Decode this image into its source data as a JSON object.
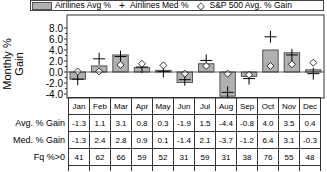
{
  "chart_data": {
    "type": "bar",
    "title": "",
    "xlabel": "",
    "ylabel": "Monthly % Gain",
    "ylim": [
      -4.0,
      9.0
    ],
    "yticks": [
      "8.0",
      "6.0",
      "4.0",
      "2.0",
      "0.0",
      "-2.0",
      "-4.0"
    ],
    "ytick_values": [
      8,
      6,
      4,
      2,
      0,
      -2,
      -4
    ],
    "grid": false,
    "legend_position": "top",
    "categories": [
      "Jan",
      "Feb",
      "Mar",
      "Apr",
      "May",
      "Jun",
      "Jul",
      "Aug",
      "Sep",
      "Oct",
      "Nov",
      "Dec"
    ],
    "series": [
      {
        "name": "Airilines Avg %",
        "kind": "bar",
        "values": [
          -1.3,
          1.1,
          3.1,
          0.8,
          0.3,
          -1.9,
          1.5,
          -4.4,
          -0.8,
          4.0,
          3.5,
          0.4
        ]
      },
      {
        "name": "Airilines Med %",
        "kind": "marker-plus",
        "values": [
          -1.3,
          2.4,
          2.8,
          0.9,
          0.1,
          -1.4,
          2.1,
          -3.7,
          -1.2,
          6.4,
          3.1,
          -0.3
        ]
      },
      {
        "name": "S&P 500 Avg. % Gain",
        "kind": "marker-diamond",
        "values": [
          0.1,
          0.1,
          1.3,
          1.5,
          1.2,
          -0.3,
          1.1,
          -0.3,
          -0.5,
          1.1,
          1.4,
          1.7
        ]
      }
    ],
    "table": {
      "header": [
        "Jan",
        "Feb",
        "Mar",
        "Apr",
        "May",
        "Jun",
        "Jul",
        "Aug",
        "Sep",
        "Oct",
        "Nov",
        "Dec"
      ],
      "rows": [
        {
          "label": "Avg. % Gain",
          "values": [
            "-1.3",
            "1.1",
            "3.1",
            "0.8",
            "0.3",
            "-1.9",
            "1.5",
            "-4.4",
            "-0.8",
            "4.0",
            "3.5",
            "0.4"
          ]
        },
        {
          "label": "Med. % Gain",
          "values": [
            "-1.3",
            "2.4",
            "2.8",
            "0.9",
            "0.1",
            "-1.4",
            "2.1",
            "-3.7",
            "-1.2",
            "6.4",
            "3.1",
            "-0.3"
          ]
        },
        {
          "label": "Fq %>0",
          "values": [
            "41",
            "62",
            "66",
            "59",
            "52",
            "31",
            "59",
            "31",
            "38",
            "76",
            "55",
            "48"
          ]
        },
        {
          "label": "Fq %>S&P 500",
          "values": [
            "41",
            "59",
            "62",
            "48",
            "38",
            "34",
            "52",
            "31",
            "52",
            "66",
            "52",
            "45"
          ]
        }
      ]
    }
  },
  "legend": {
    "bar_label": "Airilines Avg %",
    "plus_glyph": "+",
    "plus_label": "Airilines Med %",
    "diamond_glyph": "◇",
    "diamond_label": "S&P 500 Avg. % Gain"
  },
  "colors": {
    "bar_fill": "#b0b0b0",
    "bar_stroke": "#555555",
    "marker": "#000000"
  }
}
